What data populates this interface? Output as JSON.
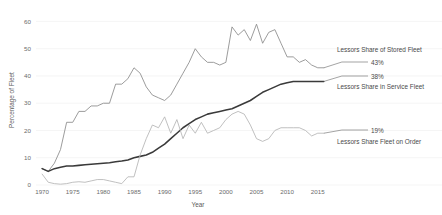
{
  "chart_data": {
    "type": "line",
    "title": "",
    "xlabel": "Year",
    "ylabel": "Percentage of Fleet",
    "xlim": [
      1969,
      2017
    ],
    "ylim": [
      0,
      62
    ],
    "grid": true,
    "legend_position": "inline-annotations",
    "x_ticks": [
      1970,
      1975,
      1980,
      1985,
      1990,
      1995,
      2000,
      2005,
      2010,
      2015
    ],
    "y_ticks": [
      0,
      10,
      20,
      30,
      40,
      50,
      60
    ],
    "series": [
      {
        "name": "Lessors Share of Stored Fleet",
        "color": "#8a8a8a",
        "end_value_label": "43%",
        "x": [
          1970,
          1971,
          1972,
          1973,
          1974,
          1975,
          1976,
          1977,
          1978,
          1979,
          1980,
          1981,
          1982,
          1983,
          1984,
          1985,
          1986,
          1987,
          1988,
          1989,
          1990,
          1991,
          1992,
          1993,
          1994,
          1995,
          1996,
          1997,
          1998,
          1999,
          2000,
          2001,
          2002,
          2003,
          2004,
          2005,
          2006,
          2007,
          2008,
          2009,
          2010,
          2011,
          2012,
          2013,
          2014,
          2015,
          2016
        ],
        "values": [
          6,
          5,
          8,
          13,
          23,
          23,
          27,
          27,
          29,
          29,
          30,
          30,
          37,
          37,
          39,
          43,
          41,
          36,
          33,
          32,
          31,
          33,
          37,
          41,
          45,
          50,
          47,
          45,
          45,
          44,
          45,
          58,
          55,
          57,
          53,
          59,
          52,
          56,
          57,
          52,
          47,
          47,
          45,
          46,
          44,
          43,
          43
        ]
      },
      {
        "name": "Lessors Share in Service Fleet",
        "color": "#3a3a3a",
        "end_value_label": "38%",
        "x": [
          1970,
          1971,
          1972,
          1973,
          1974,
          1975,
          1976,
          1977,
          1978,
          1979,
          1980,
          1981,
          1982,
          1983,
          1984,
          1985,
          1986,
          1987,
          1988,
          1989,
          1990,
          1991,
          1992,
          1993,
          1994,
          1995,
          1996,
          1997,
          1998,
          1999,
          2000,
          2001,
          2002,
          2003,
          2004,
          2005,
          2006,
          2007,
          2008,
          2009,
          2010,
          2011,
          2012,
          2013,
          2014,
          2015,
          2016
        ],
        "values": [
          6,
          5,
          6,
          6.5,
          7,
          7,
          7.2,
          7.4,
          7.6,
          7.8,
          8,
          8.2,
          8.5,
          8.8,
          9.2,
          10,
          10.5,
          11,
          12,
          13.5,
          15,
          17,
          19,
          21,
          22.5,
          24,
          25,
          26,
          26.5,
          27,
          27.5,
          28,
          29,
          30,
          31,
          32.5,
          34,
          35,
          36,
          37,
          37.5,
          38,
          38,
          38,
          38,
          38,
          38
        ]
      },
      {
        "name": "Lessors Share Fleet on Order",
        "color": "#b5b5b5",
        "end_value_label": "19%",
        "x": [
          1970,
          1971,
          1972,
          1973,
          1974,
          1975,
          1976,
          1977,
          1978,
          1979,
          1980,
          1981,
          1982,
          1983,
          1984,
          1985,
          1986,
          1987,
          1988,
          1989,
          1990,
          1991,
          1992,
          1993,
          1994,
          1995,
          1996,
          1997,
          1998,
          1999,
          2000,
          2001,
          2002,
          2003,
          2004,
          2005,
          2006,
          2007,
          2008,
          2009,
          2010,
          2011,
          2012,
          2013,
          2014,
          2015,
          2016
        ],
        "values": [
          4,
          1,
          0.5,
          0.3,
          0.5,
          1,
          1.2,
          1,
          1.5,
          2,
          2,
          1.5,
          1,
          0.5,
          3,
          3,
          11,
          17,
          22,
          21,
          25,
          19,
          24,
          17,
          22,
          19,
          23,
          19,
          20,
          21,
          24,
          26,
          27,
          26,
          22,
          17,
          16,
          17,
          20,
          21,
          21,
          21,
          21,
          20,
          18,
          19,
          19
        ]
      }
    ],
    "annotations": [
      {
        "id": "stored-fleet",
        "label": "Lessors Share of Stored Fleet",
        "value": "43%"
      },
      {
        "id": "in-service-fleet",
        "label": "Lessors Share in Service Fleet",
        "value": "38%"
      },
      {
        "id": "fleet-on-order",
        "label": "Lessors Share Fleet on Order",
        "value": "19%"
      }
    ]
  }
}
